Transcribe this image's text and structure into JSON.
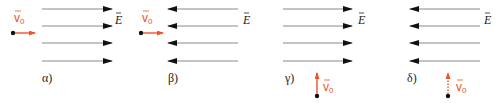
{
  "colors": {
    "field_line": "#8a8a8a",
    "arrowhead": "#111111",
    "velocity": "#e8552a",
    "charge": "#111111",
    "text": "#222222"
  },
  "labels": {
    "field": "E",
    "velocity": "v",
    "velocity_sub": "0"
  },
  "panels": [
    {
      "id": "alpha",
      "case_label": "α)",
      "field_direction": "right",
      "velocity_direction": "right",
      "velocity_style": "solid"
    },
    {
      "id": "beta",
      "case_label": "β)",
      "field_direction": "left",
      "velocity_direction": "right",
      "velocity_style": "solid"
    },
    {
      "id": "gamma",
      "case_label": "γ)",
      "field_direction": "right",
      "velocity_direction": "up",
      "velocity_style": "solid"
    },
    {
      "id": "delta",
      "case_label": "δ)",
      "field_direction": "left",
      "velocity_direction": "up",
      "velocity_style": "dotted"
    }
  ]
}
